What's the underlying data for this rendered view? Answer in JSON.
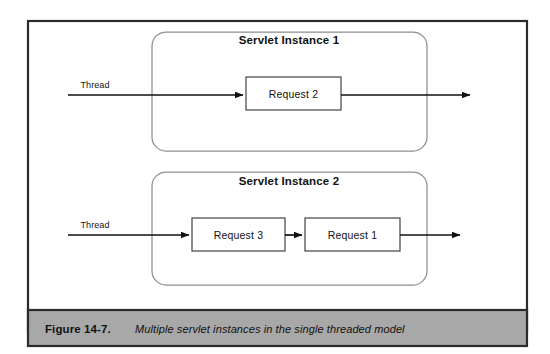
{
  "figure": {
    "number": "Figure 14-7.",
    "caption": "Multiple servlet instances in the single threaded model",
    "frame_color": "#2b2b2b",
    "caption_band_color": "#a8a8a8",
    "background_color": "#ffffff"
  },
  "diagram": {
    "type": "flow-diagram",
    "containers": [
      {
        "title": "Servlet Instance 1",
        "thread_label": "Thread",
        "requests": [
          {
            "label": "Request 2"
          }
        ]
      },
      {
        "title": "Servlet Instance 2",
        "thread_label": "Thread",
        "requests": [
          {
            "label": "Request 3"
          },
          {
            "label": "Request 1"
          }
        ]
      }
    ],
    "line_color": "#111111",
    "container_border_color": "#8f8f93",
    "request_border_color": "#3a3a3a"
  }
}
